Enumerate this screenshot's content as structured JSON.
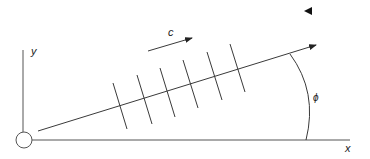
{
  "diagram": {
    "type": "plane-wave-propagation",
    "labels": {
      "x_axis": "x",
      "y_axis": "y",
      "speed": "c",
      "angle": "ϕ"
    },
    "origin": {
      "cx": 24,
      "cy": 140,
      "r": 8
    },
    "x_axis": {
      "x1": 32,
      "y1": 140,
      "x2": 350,
      "y2": 140
    },
    "y_axis": {
      "x1": 23,
      "y1": 50,
      "x2": 23,
      "y2": 132
    },
    "propagation_ray": {
      "x1": 38,
      "y1": 131,
      "x2": 316,
      "y2": 45
    },
    "speed_arrow": {
      "x1": 148,
      "y1": 51,
      "x2": 192,
      "y2": 38
    },
    "wavefronts": [
      {
        "x1": 113,
        "y1": 83,
        "x2": 127,
        "y2": 129
      },
      {
        "x1": 137,
        "y1": 75,
        "x2": 152,
        "y2": 124
      },
      {
        "x1": 160,
        "y1": 68,
        "x2": 175,
        "y2": 117
      },
      {
        "x1": 183,
        "y1": 60,
        "x2": 198,
        "y2": 108
      },
      {
        "x1": 207,
        "y1": 52,
        "x2": 222,
        "y2": 100
      },
      {
        "x1": 230,
        "y1": 44,
        "x2": 245,
        "y2": 92
      }
    ],
    "angle_arc": {
      "start": [
        290,
        54
      ],
      "control": [
        318,
        95
      ],
      "end": [
        306,
        140
      ]
    },
    "marker_triangle": {
      "x": 308,
      "y": 11,
      "direction": "left"
    },
    "colors": {
      "stroke": "#3a3a3a",
      "background": "#ffffff"
    }
  }
}
